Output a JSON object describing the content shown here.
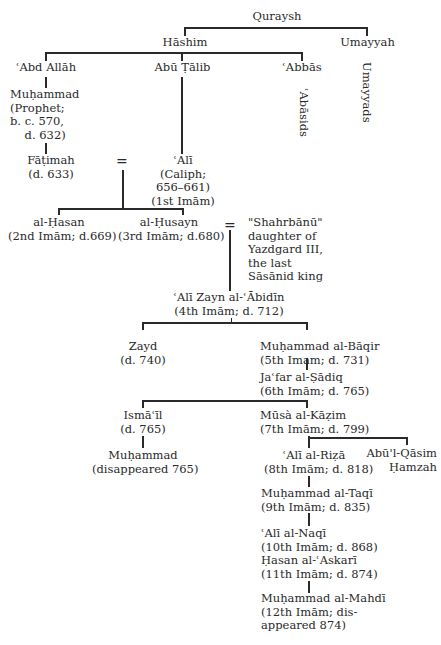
{
  "diagram": {
    "type": "genealogical-tree",
    "nodes": {
      "quraysh": "Quraysh",
      "hashim": "Hāshim",
      "umayyah": "Umayyah",
      "abd_allah": "ʿAbd Allāh",
      "abu_talib": "Abū Ṭālib",
      "abbas": "ʿAbbās",
      "abbasids": "ʿAbāsids",
      "umayyads": "Umayyads",
      "muhammad_prophet": "Muḥammad\n(Prophet;\nb. c. 570,\n    d. 632)",
      "fatimah": "Fāṭimah\n(d. 633)",
      "ali": "ʿAlī\n(Caliph;\n656–661)\n(1st Imām)",
      "hasan": "al-Ḥasan\n(2nd Imām; d.669)",
      "husayn": "al-Ḥusayn\n(3rd Imām; d.680)",
      "shahrbanu": "\"Shahrbānū\"\ndaughter of\nYazdgard III,\nthe last\nSāsānid king",
      "ali_zayn": "ʿAlī Zayn al-ʿĀbidīn\n(4th Imām; d. 712)",
      "zayd": "Zayd\n(d. 740)",
      "baqir": "Muḥammad al-Bāqir\n(5th Imam; d. 731)",
      "sadiq": "Jaʿfar al-Ṣādiq\n(6th Imām; d. 765)",
      "ismail": "Ismāʿīl\n(d. 765)",
      "kazim": "Mūsà al-Kāẓim\n(7th Imām; d. 799)",
      "muhammad_ismail": "Muḥammad\n(disappeared 765)",
      "riza": "ʿAlī al-Riẓā\n(8th Imām; d. 818)",
      "abul_qasim": "Abū'l-Qāsim\nḤamzah",
      "taqi": "Muḥammad al-Taqī\n(9th Imām; d. 835)",
      "naqi": "ʿAlī al-Naqī\n(10th Imām; d. 868)",
      "askari": "Ḥasan al-ʿAskarī\n(11th Imām; d. 874)",
      "mahdi": "Muḥammad al-Mahdī\n(12th Imām; dis-\nappeared 874)"
    },
    "marriage_symbol": "=",
    "line_color": "#2a2a2a",
    "text_color": "#2a2a2a",
    "background": "#ffffff"
  }
}
